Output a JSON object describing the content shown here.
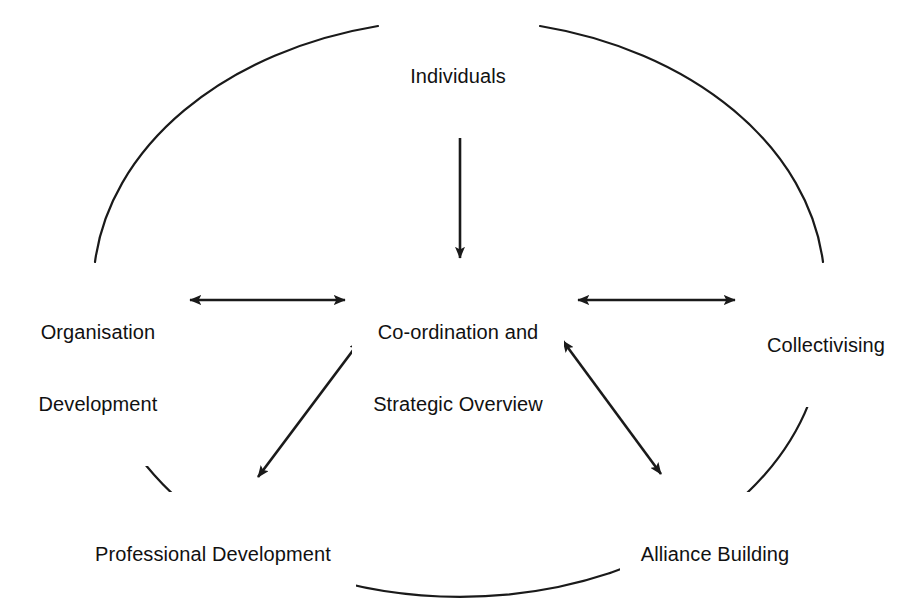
{
  "figure": {
    "type": "hub-and-spoke-diagram",
    "background_color": "#ffffff",
    "stroke_color": "#1a1a1a",
    "text_color": "#111111"
  },
  "nodes": {
    "center": {
      "id": "coordination-strategic-overview",
      "line1": "Co-ordination and",
      "line2": "Strategic Overview"
    },
    "top": {
      "id": "individuals",
      "line1": "Individuals"
    },
    "left": {
      "id": "organisation-development",
      "line1": "Organisation",
      "line2": "Development"
    },
    "right": {
      "id": "collectivising",
      "line1": "Collectivising"
    },
    "bottom_left": {
      "id": "professional-development",
      "line1": "Professional Development"
    },
    "bottom_right": {
      "id": "alliance-building",
      "line1": "Alliance Building"
    }
  },
  "connectors": [
    {
      "id": "center-to-individuals",
      "from": "coordination-strategic-overview",
      "to": "individuals",
      "style": "double-headed-arrow",
      "orientation": "vertical"
    },
    {
      "id": "center-to-organisation-development",
      "from": "coordination-strategic-overview",
      "to": "organisation-development",
      "style": "double-headed-arrow",
      "orientation": "horizontal"
    },
    {
      "id": "center-to-collectivising",
      "from": "coordination-strategic-overview",
      "to": "collectivising",
      "style": "double-headed-arrow",
      "orientation": "horizontal"
    },
    {
      "id": "center-to-professional-development",
      "from": "coordination-strategic-overview",
      "to": "professional-development",
      "style": "double-headed-arrow",
      "orientation": "diagonal"
    },
    {
      "id": "center-to-alliance-building",
      "from": "coordination-strategic-overview",
      "to": "alliance-building",
      "style": "double-headed-arrow",
      "orientation": "diagonal"
    }
  ],
  "enclosure": {
    "id": "surrounding-ellipse",
    "shape": "ellipse",
    "stroke_color": "#1a1a1a"
  }
}
